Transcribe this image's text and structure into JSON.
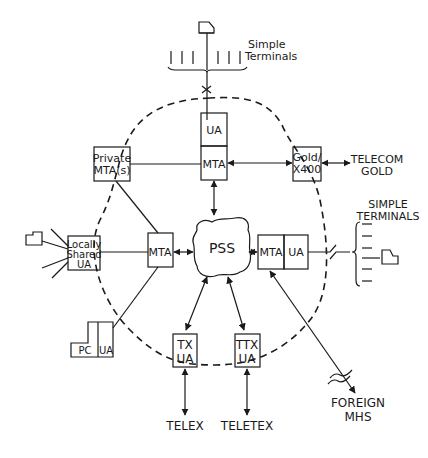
{
  "diagram": {
    "title": "",
    "colors": {
      "line": "#1a1a1a",
      "background": "#ffffff"
    },
    "nodes": {
      "top_ua": "UA",
      "top_mta": "MTA",
      "private_mta_1": "Private",
      "private_mta_2": "MTA(s)",
      "gold_1": "Gold/",
      "gold_2": "X400",
      "telecom_gold_1": "TELECOM",
      "telecom_gold_2": "GOLD",
      "simple_terminals_top_1": "Simple",
      "simple_terminals_top_2": "Terminals",
      "locally_shared_1": "Locally",
      "locally_shared_2": "Shared",
      "locally_shared_3": "UA",
      "left_mta": "MTA",
      "pss": "PSS",
      "right_mta": "MTA",
      "right_ua": "UA",
      "simple_terminals_right_1": "SIMPLE",
      "simple_terminals_right_2": "TERMINALS",
      "pc": "PC",
      "pc_ua": "UA",
      "tx_ua_1": "TX",
      "tx_ua_2": "UA",
      "ttx_ua_1": "TTX",
      "ttx_ua_2": "UA",
      "telex": "TELEX",
      "teletex": "TELETEX",
      "foreign_mhs_1": "FOREIGN",
      "foreign_mhs_2": "MHS"
    }
  }
}
